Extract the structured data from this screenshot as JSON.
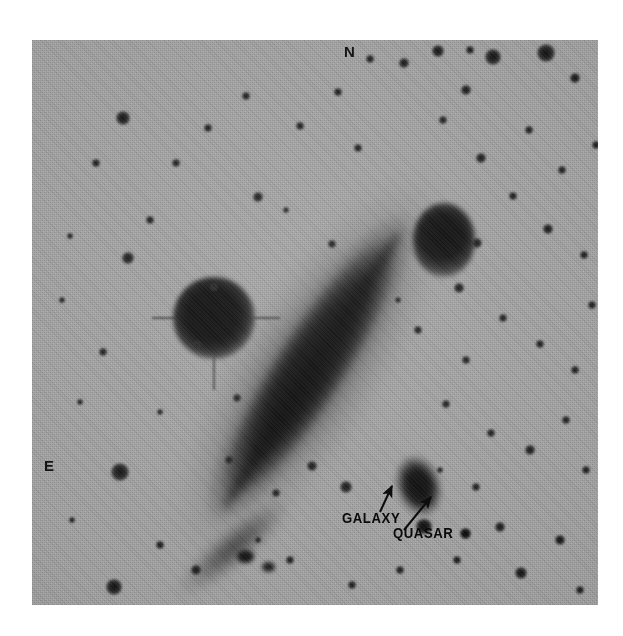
{
  "figure": {
    "kind": "astronomical-photographic-plate",
    "background_color": "#ffffff",
    "plate_color": "#a9a9a9",
    "ink_color": "#0a0a0a"
  },
  "compass": {
    "north_label": "N",
    "east_label": "E"
  },
  "annotations": [
    {
      "id": "galaxy",
      "label": "GALAXY",
      "arrow_from": [
        380,
        512
      ],
      "arrow_to": [
        392,
        485
      ]
    },
    {
      "id": "quasar",
      "label": "QUASAR",
      "arrow_from": [
        404,
        530
      ],
      "arrow_to": [
        431,
        497
      ]
    }
  ],
  "objects": {
    "main_galaxy": {
      "name": "edge-on spiral galaxy",
      "center": [
        278,
        328
      ],
      "position_angle_deg": -57.5,
      "major_axis_px": 370,
      "minor_axis_px": 88
    },
    "companion_galaxy": {
      "name": "companion galaxy",
      "center": [
        387,
        447
      ],
      "major_axis_px": 66,
      "minor_axis_px": 48
    },
    "quasar": {
      "name": "quasar point source",
      "center": [
        433,
        493
      ],
      "size_px": 11
    },
    "bright_star": {
      "name": "bright foreground star",
      "center": [
        182,
        278
      ],
      "size_px": 82
    }
  },
  "field_stars": [
    {
      "x": 123,
      "y": 118,
      "r": 7
    },
    {
      "x": 96,
      "y": 163,
      "r": 4
    },
    {
      "x": 70,
      "y": 236,
      "r": 3
    },
    {
      "x": 62,
      "y": 300,
      "r": 3
    },
    {
      "x": 103,
      "y": 352,
      "r": 4
    },
    {
      "x": 80,
      "y": 402,
      "r": 3
    },
    {
      "x": 120,
      "y": 472,
      "r": 9
    },
    {
      "x": 114,
      "y": 587,
      "r": 8
    },
    {
      "x": 72,
      "y": 520,
      "r": 3
    },
    {
      "x": 160,
      "y": 545,
      "r": 4
    },
    {
      "x": 196,
      "y": 570,
      "r": 5
    },
    {
      "x": 150,
      "y": 220,
      "r": 4
    },
    {
      "x": 176,
      "y": 163,
      "r": 4
    },
    {
      "x": 208,
      "y": 128,
      "r": 4
    },
    {
      "x": 246,
      "y": 96,
      "r": 4
    },
    {
      "x": 258,
      "y": 197,
      "r": 5
    },
    {
      "x": 214,
      "y": 287,
      "r": 4
    },
    {
      "x": 197,
      "y": 345,
      "r": 4
    },
    {
      "x": 237,
      "y": 398,
      "r": 4
    },
    {
      "x": 229,
      "y": 460,
      "r": 4
    },
    {
      "x": 276,
      "y": 493,
      "r": 4
    },
    {
      "x": 312,
      "y": 466,
      "r": 5
    },
    {
      "x": 346,
      "y": 487,
      "r": 6
    },
    {
      "x": 300,
      "y": 126,
      "r": 4
    },
    {
      "x": 338,
      "y": 92,
      "r": 4
    },
    {
      "x": 370,
      "y": 59,
      "r": 4
    },
    {
      "x": 404,
      "y": 63,
      "r": 5
    },
    {
      "x": 438,
      "y": 51,
      "r": 6
    },
    {
      "x": 470,
      "y": 50,
      "r": 4
    },
    {
      "x": 493,
      "y": 57,
      "r": 8
    },
    {
      "x": 546,
      "y": 53,
      "r": 9
    },
    {
      "x": 575,
      "y": 78,
      "r": 5
    },
    {
      "x": 466,
      "y": 90,
      "r": 5
    },
    {
      "x": 443,
      "y": 120,
      "r": 4
    },
    {
      "x": 481,
      "y": 158,
      "r": 5
    },
    {
      "x": 529,
      "y": 130,
      "r": 4
    },
    {
      "x": 562,
      "y": 170,
      "r": 4
    },
    {
      "x": 513,
      "y": 196,
      "r": 4
    },
    {
      "x": 548,
      "y": 229,
      "r": 5
    },
    {
      "x": 584,
      "y": 255,
      "r": 4
    },
    {
      "x": 477,
      "y": 243,
      "r": 5
    },
    {
      "x": 459,
      "y": 288,
      "r": 5
    },
    {
      "x": 503,
      "y": 318,
      "r": 4
    },
    {
      "x": 540,
      "y": 344,
      "r": 4
    },
    {
      "x": 575,
      "y": 370,
      "r": 4
    },
    {
      "x": 466,
      "y": 360,
      "r": 4
    },
    {
      "x": 446,
      "y": 404,
      "r": 4
    },
    {
      "x": 491,
      "y": 433,
      "r": 4
    },
    {
      "x": 530,
      "y": 450,
      "r": 5
    },
    {
      "x": 566,
      "y": 420,
      "r": 4
    },
    {
      "x": 586,
      "y": 470,
      "r": 4
    },
    {
      "x": 476,
      "y": 487,
      "r": 4
    },
    {
      "x": 500,
      "y": 527,
      "r": 5
    },
    {
      "x": 457,
      "y": 560,
      "r": 4
    },
    {
      "x": 521,
      "y": 573,
      "r": 6
    },
    {
      "x": 560,
      "y": 540,
      "r": 5
    },
    {
      "x": 580,
      "y": 590,
      "r": 4
    },
    {
      "x": 400,
      "y": 570,
      "r": 4
    },
    {
      "x": 352,
      "y": 585,
      "r": 4
    },
    {
      "x": 290,
      "y": 560,
      "r": 4
    },
    {
      "x": 258,
      "y": 540,
      "r": 3
    },
    {
      "x": 332,
      "y": 244,
      "r": 4
    },
    {
      "x": 358,
      "y": 148,
      "r": 4
    },
    {
      "x": 286,
      "y": 210,
      "r": 3
    },
    {
      "x": 418,
      "y": 330,
      "r": 4
    },
    {
      "x": 398,
      "y": 300,
      "r": 3
    },
    {
      "x": 440,
      "y": 470,
      "r": 3
    },
    {
      "x": 160,
      "y": 412,
      "r": 3
    },
    {
      "x": 128,
      "y": 258,
      "r": 6
    },
    {
      "x": 592,
      "y": 305,
      "r": 4
    },
    {
      "x": 596,
      "y": 145,
      "r": 4
    }
  ]
}
